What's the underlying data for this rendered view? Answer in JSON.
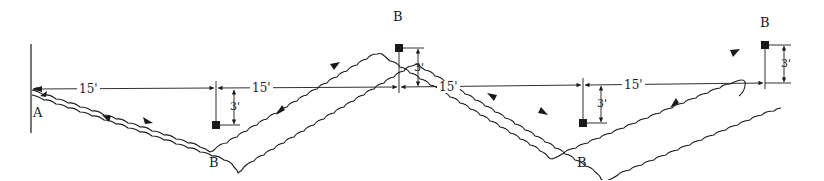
{
  "diagram": {
    "colors": {
      "ink": "#1a1a1a",
      "background": "#ffffff"
    },
    "points": [
      {
        "id": "A",
        "label": "A"
      },
      {
        "id": "B1",
        "label": "B"
      },
      {
        "id": "B2",
        "label": "B"
      },
      {
        "id": "B3",
        "label": "B"
      },
      {
        "id": "B4",
        "label": "B"
      }
    ],
    "horizontal_dimensions": [
      {
        "label": "15'"
      },
      {
        "label": "15'"
      },
      {
        "label": "15'"
      },
      {
        "label": "15'"
      }
    ],
    "vertical_dimensions": [
      {
        "label": "3'"
      },
      {
        "label": "3'"
      },
      {
        "label": "3'"
      },
      {
        "label": "3'"
      }
    ],
    "markers": [
      {
        "type": "square",
        "count": 4
      }
    ],
    "path": {
      "description": "Zig-zag double wavy path from A through alternating B points with direction arrows, looping at final B",
      "direction_arrows": 10
    }
  }
}
